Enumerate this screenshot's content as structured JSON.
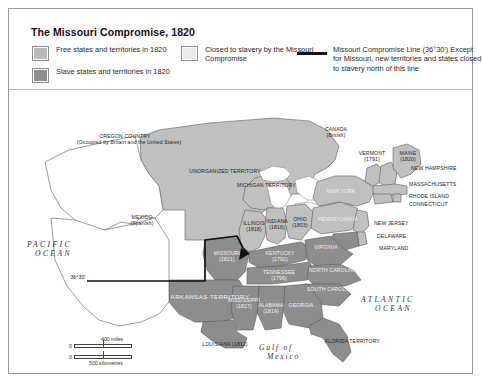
{
  "title": "The Missouri Compromise, 1820",
  "legend": {
    "free": {
      "label": "Free states and territories in 1820",
      "color": "#b9b9b9"
    },
    "slave": {
      "label": "Slave states and territories in 1820",
      "color": "#8d8d8d"
    },
    "closed": {
      "label": "Closed to slavery by the Missouri Compromise",
      "color": "#e9e9e9"
    },
    "line": {
      "title": "Missouri Compromise Line (36°30')",
      "note": "Except for Missouri, new territories and states closed to slavery north of this line",
      "color": "#111111"
    }
  },
  "map": {
    "regions": [
      {
        "name": "OREGON COUNTRY",
        "sub": "(Occupied by Britain and the United States)"
      },
      {
        "name": "UNORGANIZED TERRITORY"
      },
      {
        "name": "MEXICO",
        "sub": "(Spanish)"
      },
      {
        "name": "CANADA",
        "sub": "(British)"
      },
      {
        "name": "MICHIGAN TERRITORY"
      },
      {
        "name": "ARKANSAS TERRITORY"
      },
      {
        "name": "FLORIDA TERRITORY"
      }
    ],
    "states": [
      {
        "name": "MISSOURI",
        "year": "(1821)"
      },
      {
        "name": "ILLINOIS",
        "year": "(1818)"
      },
      {
        "name": "INDIANA",
        "year": "(1816)"
      },
      {
        "name": "OHIO",
        "year": "(1803)"
      },
      {
        "name": "KENTUCKY",
        "year": "(1792)"
      },
      {
        "name": "TENNESSEE",
        "year": "(1796)"
      },
      {
        "name": "MISSISSIPPI",
        "year": "(1817)"
      },
      {
        "name": "ALABAMA",
        "year": "(1819)"
      },
      {
        "name": "LOUISIANA",
        "year": "(1812)"
      },
      {
        "name": "GEORGIA",
        "year": ""
      },
      {
        "name": "VIRGINIA",
        "year": ""
      },
      {
        "name": "NORTH CAROLINA",
        "year": ""
      },
      {
        "name": "SOUTH CAROLINA",
        "year": ""
      },
      {
        "name": "VERMONT",
        "year": "(1791)"
      },
      {
        "name": "MAINE",
        "year": "(1820)"
      },
      {
        "name": "NEW HAMPSHIRE",
        "year": ""
      },
      {
        "name": "MASSACHUSETTS",
        "year": ""
      },
      {
        "name": "RHODE ISLAND",
        "year": ""
      },
      {
        "name": "CONNECTICUT",
        "year": ""
      },
      {
        "name": "NEW YORK",
        "year": ""
      },
      {
        "name": "PENNSYLVANIA",
        "year": ""
      },
      {
        "name": "NEW JERSEY",
        "year": ""
      },
      {
        "name": "DELAWARE",
        "year": ""
      },
      {
        "name": "MARYLAND",
        "year": ""
      }
    ],
    "oceans": [
      {
        "l1": "PACIFIC",
        "l2": "OCEAN"
      },
      {
        "l1": "ATLANTIC",
        "l2": "OCEAN"
      },
      {
        "l1": "Gulf of",
        "l2": "Mexico"
      }
    ],
    "line_label": "36°30'"
  },
  "scale": {
    "zero": "0",
    "miles": "400 miles",
    "km": "500 kilometres"
  }
}
